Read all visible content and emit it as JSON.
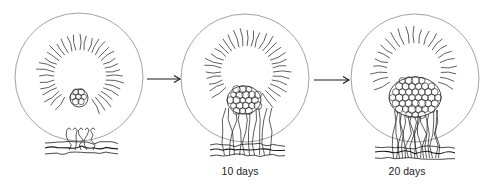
{
  "diagram": {
    "type": "process-sequence",
    "stroke_color": "#1a1a1a",
    "outline_color": "#8a8a8a",
    "panels": [
      {
        "id": "stage-1",
        "label": "",
        "outer_circle": {
          "cx": 79,
          "cy": 77,
          "r": 64
        },
        "inner_hollow": {
          "cx": 80,
          "cy": 76,
          "r": 24
        },
        "radial_fibers": {
          "count": 40,
          "length": 16
        },
        "cell_cluster": {
          "cx": 79,
          "cy": 98,
          "rx": 9,
          "ry": 9,
          "cell_r": 3
        },
        "hyphae": {
          "count": 5,
          "top_y": 130,
          "bottom_y": 150,
          "x_min": 66,
          "x_max": 96
        },
        "substrate": {
          "x_min": 45,
          "x_max": 118,
          "y": 148
        }
      },
      {
        "id": "stage-2",
        "label": "10 days",
        "label_pos": {
          "x": 240,
          "y": 166
        },
        "outer_circle": {
          "cx": 245,
          "cy": 78,
          "r": 64
        },
        "inner_hollow": {
          "cx": 247,
          "cy": 72,
          "r": 24
        },
        "radial_fibers": {
          "count": 40,
          "length": 16
        },
        "cell_cluster": {
          "cx": 244,
          "cy": 100,
          "rx": 17,
          "ry": 14,
          "cell_r": 3.4
        },
        "hyphae": {
          "count": 10,
          "top_y": 108,
          "bottom_y": 155,
          "x_min": 222,
          "x_max": 272
        },
        "substrate": {
          "x_min": 210,
          "x_max": 285,
          "y": 150
        }
      },
      {
        "id": "stage-3",
        "label": "20 days",
        "label_pos": {
          "x": 407,
          "y": 166
        },
        "outer_circle": {
          "cx": 415,
          "cy": 78,
          "r": 64
        },
        "inner_hollow": {
          "cx": 414,
          "cy": 70,
          "r": 25
        },
        "radial_fibers": {
          "count": 34,
          "length": 16
        },
        "cell_cluster": {
          "cx": 415,
          "cy": 97,
          "rx": 26,
          "ry": 20,
          "cell_r": 3.6
        },
        "hyphae": {
          "count": 16,
          "top_y": 110,
          "bottom_y": 158,
          "x_min": 392,
          "x_max": 440
        },
        "substrate": {
          "x_min": 375,
          "x_max": 455,
          "y": 152
        }
      }
    ],
    "arrows": [
      {
        "from": "stage-1",
        "to": "stage-2",
        "x1": 147,
        "x2": 180,
        "y": 79
      },
      {
        "from": "stage-2",
        "to": "stage-3",
        "x1": 314,
        "x2": 349,
        "y": 80
      }
    ]
  }
}
